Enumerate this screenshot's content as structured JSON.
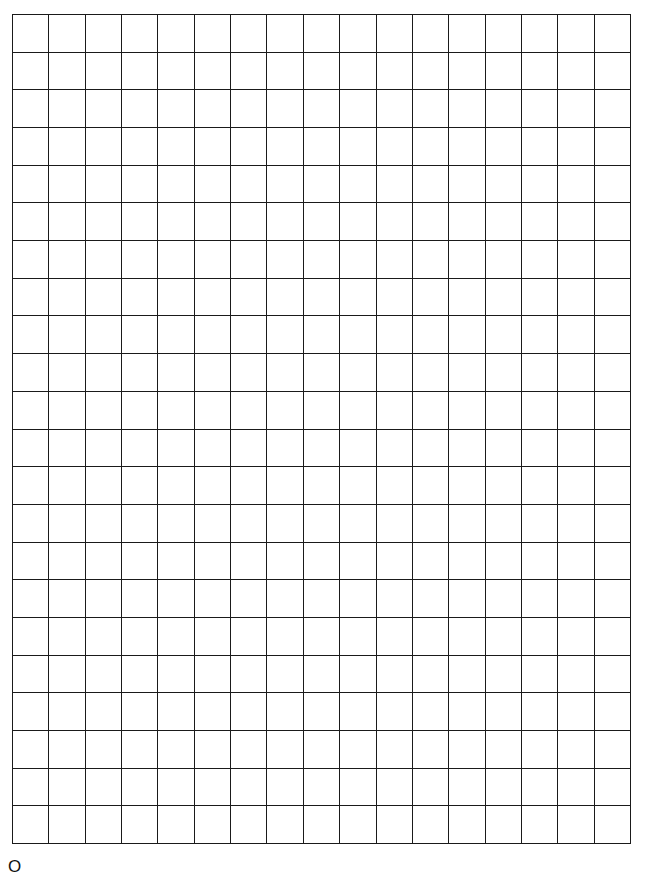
{
  "grid": {
    "columns": 17,
    "rows": 22,
    "line_color": "#1a1a1a",
    "background": "#ffffff"
  },
  "footer": {
    "label": "O"
  }
}
